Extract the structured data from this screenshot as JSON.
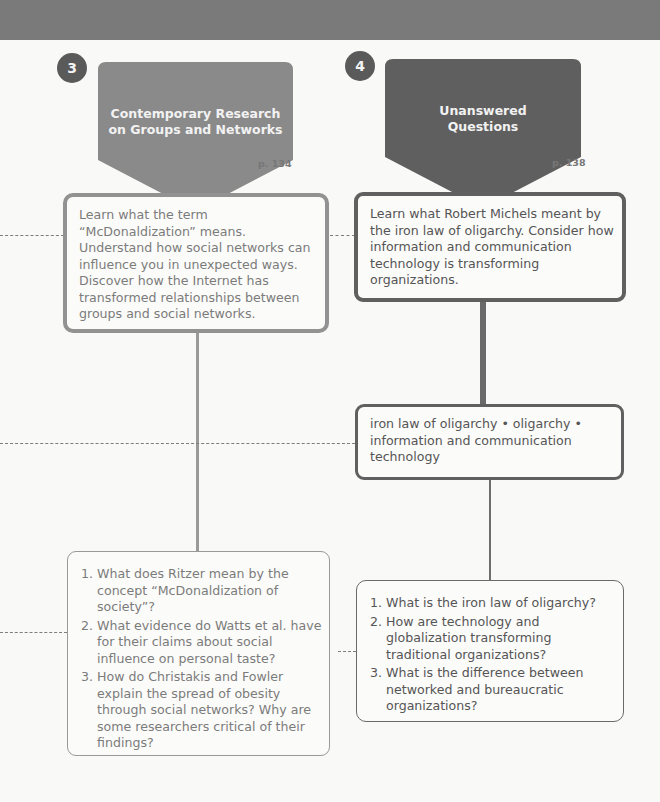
{
  "colors": {
    "section3_fill": "#8a8a8a",
    "section4_fill": "#5f5f5f",
    "badge_fill": "#5a5a5a",
    "dash_line": "#7d7d7d"
  },
  "sections": [
    {
      "number": "3",
      "title_line1": "Contemporary Research",
      "title_line2": "on Groups and Networks",
      "page_ref": "p. 134",
      "objectives": "Learn what the term “McDonaldization” means. Understand how social networks can influence you in unexpected ways. Discover how the Internet has transformed relationships between groups and social networks.",
      "questions": [
        "What does Ritzer mean by the concept “McDonaldization of society”?",
        "What evidence do Watts et al. have for their claims about social influence on personal taste?",
        "How do Christakis and Fowler explain the spread of obesity through social networks? Why are some researchers critical of their findings?"
      ]
    },
    {
      "number": "4",
      "title_line1": "Unanswered",
      "title_line2": "Questions",
      "page_ref": "p. 138",
      "objectives": "Learn what Robert Michels meant by the iron law of oligarchy. Consider how information and communication technology is transforming organizations.",
      "key_terms": "iron law of oligarchy • oligarchy • information and communication technology",
      "questions": [
        "What is the iron law of oligarchy?",
        "How are technology and globalization transforming traditional organizations?",
        "What is the difference between networked and bureaucratic organizations?"
      ]
    }
  ]
}
